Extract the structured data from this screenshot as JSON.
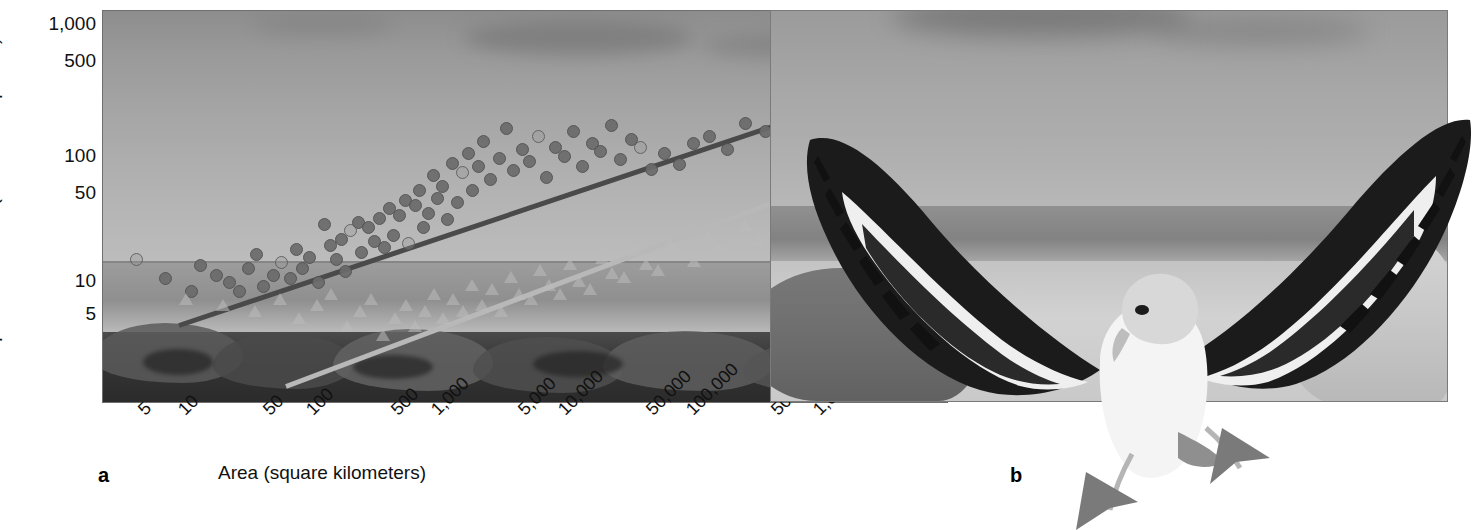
{
  "figure": {
    "panels": [
      {
        "id": "a",
        "label": "a",
        "type": "chart"
      },
      {
        "id": "b",
        "label": "b",
        "type": "photograph",
        "subject": "albatross-in-flight"
      }
    ]
  },
  "chart_data": {
    "type": "scatter",
    "title": "",
    "xlabel": "Area (square kilometers)",
    "ylabel": "Species richness (number of species)",
    "xscale": "log",
    "yscale": "log",
    "xticks": [
      "5",
      "10",
      "50",
      "100",
      "500",
      "1,000",
      "5,000",
      "10,000",
      "50,000",
      "100,000",
      "500,000",
      "1,000,000"
    ],
    "xtick_values": [
      5,
      10,
      50,
      100,
      500,
      1000,
      5000,
      10000,
      50000,
      100000,
      500000,
      1000000
    ],
    "yticks": [
      "1,000",
      "500",
      "100",
      "50",
      "10",
      "5"
    ],
    "ytick_values": [
      1000,
      500,
      100,
      50,
      10,
      5
    ],
    "xlim": [
      3,
      2000000
    ],
    "ylim": [
      2,
      1400
    ],
    "grid": false,
    "legend_position": "inside-right",
    "series": [
      {
        "name": "islands less than 300 kilometers from source",
        "marker": "circle",
        "color": "#6b6b6b",
        "trendline": {
          "present": true,
          "color": "#4a4a4a"
        },
        "points": [
          [
            5,
            22
          ],
          [
            8,
            16
          ],
          [
            12,
            13
          ],
          [
            14,
            20
          ],
          [
            18,
            17
          ],
          [
            22,
            15
          ],
          [
            26,
            13
          ],
          [
            30,
            19
          ],
          [
            34,
            24
          ],
          [
            38,
            14
          ],
          [
            44,
            17
          ],
          [
            50,
            21
          ],
          [
            58,
            16
          ],
          [
            64,
            26
          ],
          [
            70,
            19
          ],
          [
            78,
            23
          ],
          [
            90,
            15
          ],
          [
            100,
            40
          ],
          [
            110,
            28
          ],
          [
            120,
            22
          ],
          [
            130,
            31
          ],
          [
            140,
            18
          ],
          [
            150,
            36
          ],
          [
            170,
            41
          ],
          [
            180,
            25
          ],
          [
            200,
            38
          ],
          [
            220,
            30
          ],
          [
            240,
            44
          ],
          [
            260,
            27
          ],
          [
            280,
            52
          ],
          [
            300,
            33
          ],
          [
            330,
            46
          ],
          [
            360,
            60
          ],
          [
            380,
            29
          ],
          [
            420,
            55
          ],
          [
            450,
            70
          ],
          [
            480,
            38
          ],
          [
            520,
            48
          ],
          [
            560,
            90
          ],
          [
            600,
            62
          ],
          [
            650,
            75
          ],
          [
            700,
            43
          ],
          [
            760,
            110
          ],
          [
            820,
            58
          ],
          [
            900,
            95
          ],
          [
            980,
            130
          ],
          [
            1050,
            70
          ],
          [
            1150,
            105
          ],
          [
            1250,
            160
          ],
          [
            1400,
            85
          ],
          [
            1600,
            120
          ],
          [
            1800,
            200
          ],
          [
            2000,
            98
          ],
          [
            2300,
            140
          ],
          [
            2600,
            115
          ],
          [
            3000,
            175
          ],
          [
            3400,
            88
          ],
          [
            3900,
            145
          ],
          [
            4500,
            125
          ],
          [
            5200,
            190
          ],
          [
            6000,
            105
          ],
          [
            7000,
            155
          ],
          [
            8000,
            135
          ],
          [
            9500,
            210
          ],
          [
            11000,
            118
          ],
          [
            13000,
            165
          ],
          [
            15000,
            145
          ],
          [
            18000,
            100
          ],
          [
            22000,
            130
          ],
          [
            28000,
            108
          ],
          [
            35000,
            155
          ],
          [
            45000,
            175
          ],
          [
            60000,
            140
          ],
          [
            80000,
            215
          ],
          [
            110000,
            190
          ],
          [
            150000,
            260
          ],
          [
            200000,
            230
          ],
          [
            280000,
            310
          ],
          [
            380000,
            275
          ],
          [
            500000,
            350
          ],
          [
            650000,
            300
          ]
        ]
      },
      {
        "name": "islands more than 300 kilometers from source",
        "marker": "triangle",
        "color": "#bcbcbc",
        "trendline": {
          "present": true,
          "color": "#b8b8b8"
        },
        "points": [
          [
            10,
            11
          ],
          [
            18,
            10
          ],
          [
            30,
            9
          ],
          [
            45,
            11
          ],
          [
            60,
            8
          ],
          [
            80,
            10
          ],
          [
            100,
            12
          ],
          [
            130,
            7
          ],
          [
            160,
            9
          ],
          [
            190,
            11
          ],
          [
            230,
            6
          ],
          [
            280,
            8
          ],
          [
            330,
            10
          ],
          [
            380,
            7
          ],
          [
            450,
            9
          ],
          [
            520,
            12
          ],
          [
            600,
            8
          ],
          [
            700,
            11
          ],
          [
            820,
            9
          ],
          [
            950,
            14
          ],
          [
            1100,
            10
          ],
          [
            1300,
            13
          ],
          [
            1500,
            9
          ],
          [
            1750,
            16
          ],
          [
            2000,
            12
          ],
          [
            2400,
            11
          ],
          [
            2800,
            18
          ],
          [
            3200,
            14
          ],
          [
            3800,
            12
          ],
          [
            4500,
            20
          ],
          [
            5200,
            15
          ],
          [
            6200,
            13
          ],
          [
            7500,
            22
          ],
          [
            8800,
            17
          ],
          [
            10500,
            16
          ],
          [
            12500,
            25
          ],
          [
            15000,
            20
          ],
          [
            18000,
            18
          ],
          [
            22000,
            28
          ],
          [
            26000,
            23
          ],
          [
            32000,
            21
          ],
          [
            40000,
            32
          ],
          [
            48000,
            26
          ],
          [
            58000,
            24
          ],
          [
            72000,
            38
          ],
          [
            90000,
            30
          ],
          [
            115000,
            35
          ],
          [
            150000,
            45
          ],
          [
            200000,
            40
          ],
          [
            300000,
            55
          ],
          [
            450000,
            75
          ],
          [
            600000,
            100
          ]
        ]
      }
    ],
    "annotations": [
      {
        "text": "islands less than 300 kilometers from source",
        "at_px": [
          818,
          78
        ]
      },
      {
        "text": "islands more than 300 kilometers from source",
        "at_px": [
          818,
          134
        ]
      }
    ]
  }
}
